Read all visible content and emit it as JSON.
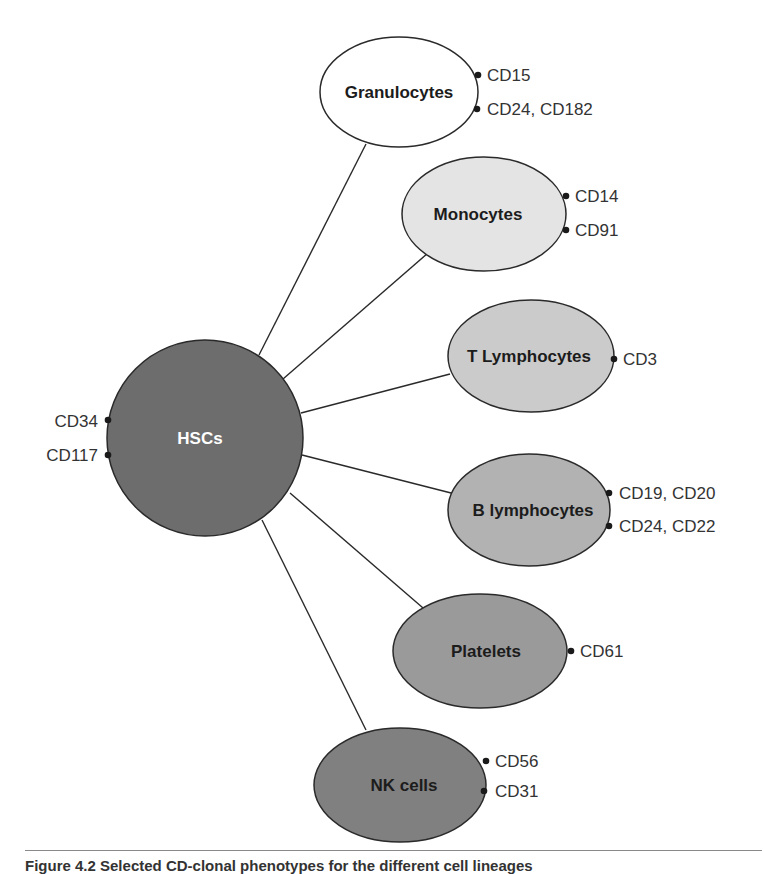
{
  "diagram": {
    "center": {
      "label": "HSCs",
      "markers": [
        "CD34",
        "CD117"
      ],
      "fill": "#6d6d6d"
    },
    "nodes": [
      {
        "label": "Granulocytes",
        "markers": [
          "CD15",
          "CD24, CD182"
        ],
        "fill": "#ffffff"
      },
      {
        "label": "Monocytes",
        "markers": [
          "CD14",
          "CD91"
        ],
        "fill": "#e4e4e4"
      },
      {
        "label": "T Lymphocytes",
        "markers": [
          "CD3"
        ],
        "fill": "#cbcbcb"
      },
      {
        "label": "B lymphocytes",
        "markers": [
          "CD19, CD20",
          "CD24, CD22"
        ],
        "fill": "#b2b2b2"
      },
      {
        "label": "Platelets",
        "markers": [
          "CD61"
        ],
        "fill": "#9a9a9a"
      },
      {
        "label": "NK cells",
        "markers": [
          "CD56",
          "CD31"
        ],
        "fill": "#808080"
      }
    ]
  },
  "caption": "Figure 4.2  Selected CD-clonal phenotypes for the different cell lineages"
}
